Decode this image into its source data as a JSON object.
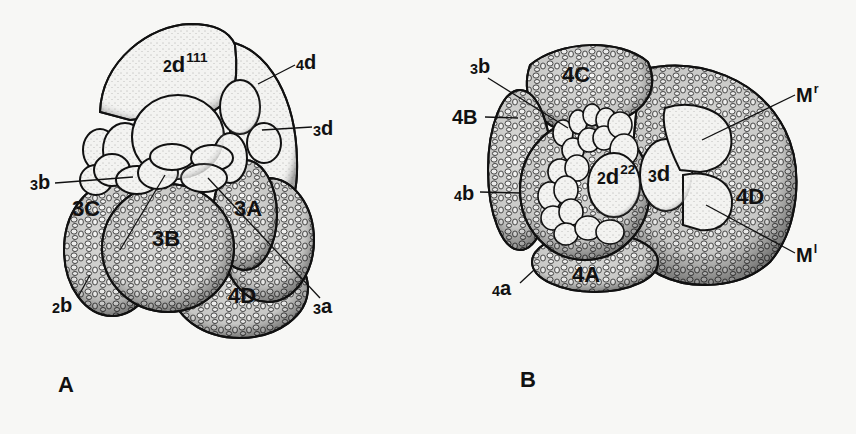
{
  "figure": {
    "background": "#f7f7f5",
    "ink_color": "#111111",
    "panels": [
      {
        "id": "A",
        "letter": "A",
        "labels": [
          {
            "id": "2d111",
            "prefix": "2",
            "base": "d",
            "sup": "111",
            "text": "2d111"
          },
          {
            "id": "4d",
            "prefix": "4",
            "base": "d",
            "sup": "",
            "text": "4d"
          },
          {
            "id": "3d",
            "prefix": "3",
            "base": "d",
            "sup": "",
            "text": "3d"
          },
          {
            "id": "3b",
            "prefix": "3",
            "base": "b",
            "sup": "",
            "text": "3b"
          },
          {
            "id": "3C",
            "prefix": "",
            "base": "3C",
            "sup": "",
            "text": "3C"
          },
          {
            "id": "3A",
            "prefix": "",
            "base": "3A",
            "sup": "",
            "text": "3A"
          },
          {
            "id": "3B",
            "prefix": "",
            "base": "3B",
            "sup": "",
            "text": "3B"
          },
          {
            "id": "4D",
            "prefix": "",
            "base": "4D",
            "sup": "",
            "text": "4D"
          },
          {
            "id": "2b",
            "prefix": "2",
            "base": "b",
            "sup": "",
            "text": "2b"
          },
          {
            "id": "3a",
            "prefix": "3",
            "base": "a",
            "sup": "",
            "text": "3a"
          }
        ]
      },
      {
        "id": "B",
        "letter": "B",
        "labels": [
          {
            "id": "3b",
            "prefix": "3",
            "base": "b",
            "sup": "",
            "text": "3b"
          },
          {
            "id": "4C",
            "prefix": "",
            "base": "4C",
            "sup": "",
            "text": "4C"
          },
          {
            "id": "4B",
            "prefix": "",
            "base": "4B",
            "sup": "",
            "text": "4B"
          },
          {
            "id": "Mr",
            "prefix": "",
            "base": "M",
            "sup": "r",
            "text": "Mr"
          },
          {
            "id": "4b",
            "prefix": "4",
            "base": "b",
            "sup": "",
            "text": "4b"
          },
          {
            "id": "2d22",
            "prefix": "2",
            "base": "d",
            "sup": "22",
            "text": "2d22"
          },
          {
            "id": "3d",
            "prefix": "3",
            "base": "d",
            "sup": "",
            "text": "3d"
          },
          {
            "id": "4D",
            "prefix": "",
            "base": "4D",
            "sup": "",
            "text": "4D"
          },
          {
            "id": "Ml",
            "prefix": "",
            "base": "M",
            "sup": "l",
            "text": "Ml"
          },
          {
            "id": "4a",
            "prefix": "4",
            "base": "a",
            "sup": "",
            "text": "4a"
          },
          {
            "id": "4A",
            "prefix": "",
            "base": "4A",
            "sup": "",
            "text": "4A"
          }
        ]
      }
    ]
  }
}
